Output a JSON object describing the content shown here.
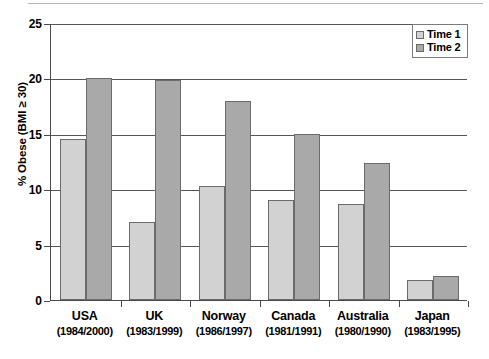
{
  "chart_data": {
    "type": "bar",
    "title": "",
    "xlabel": "",
    "ylabel": "% Obese (BMI ≥ 30)",
    "ylim": [
      0,
      25
    ],
    "yticks": [
      "0",
      "5",
      "10",
      "15",
      "20",
      "25"
    ],
    "grid": true,
    "legend_position": "top-right",
    "categories": [
      {
        "name": "USA",
        "years": "(1984/2000)"
      },
      {
        "name": "UK",
        "years": "(1983/1999)"
      },
      {
        "name": "Norway",
        "years": "(1986/1997)"
      },
      {
        "name": "Canada",
        "years": "(1981/1991)"
      },
      {
        "name": "Australia",
        "years": "(1980/1990)"
      },
      {
        "name": "Japan",
        "years": "(1983/1995)"
      }
    ],
    "series": [
      {
        "name": "Time 1",
        "color": "#d2d2d2",
        "values": [
          14.5,
          7.0,
          10.3,
          9.0,
          8.7,
          1.8
        ]
      },
      {
        "name": "Time 2",
        "color": "#a9a9a9",
        "values": [
          20.0,
          19.9,
          18.0,
          15.0,
          12.4,
          2.2
        ]
      }
    ]
  }
}
